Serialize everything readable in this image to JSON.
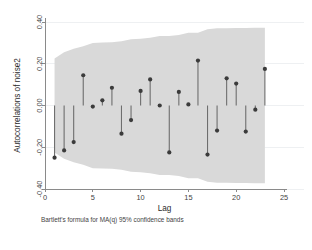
{
  "chart_data": {
    "type": "bar",
    "title": "",
    "subtitle": "",
    "xlabel": "Lag",
    "ylabel": "Autocorrelations of noise2",
    "note": "Bartlett's formula for MA(q) 95% confidence bands",
    "grid": true,
    "legend": null,
    "xlim": [
      0,
      25
    ],
    "ylim": [
      -0.4,
      0.4
    ],
    "xticks": [
      0,
      5,
      10,
      15,
      20,
      25
    ],
    "xticklabels": [
      "0",
      "5",
      "10",
      "15",
      "20",
      "25"
    ],
    "yticks": [
      -0.4,
      -0.2,
      0.0,
      0.2,
      0.4
    ],
    "yticklabels": [
      "-0.40",
      "-0.20",
      "0.00",
      "0.20",
      "0.40"
    ],
    "x": [
      1,
      2,
      3,
      4,
      5,
      6,
      7,
      8,
      9,
      10,
      11,
      12,
      13,
      14,
      15,
      16,
      17,
      18,
      19,
      20,
      21,
      22,
      23
    ],
    "categories": [
      "1",
      "2",
      "3",
      "4",
      "5",
      "6",
      "7",
      "8",
      "9",
      "10",
      "11",
      "12",
      "13",
      "14",
      "15",
      "16",
      "17",
      "18",
      "19",
      "20",
      "21",
      "22",
      "23"
    ],
    "values": [
      -0.25,
      -0.215,
      -0.175,
      0.145,
      -0.005,
      0.025,
      0.085,
      -0.135,
      -0.07,
      0.07,
      0.125,
      0.0,
      -0.225,
      0.065,
      0.005,
      0.215,
      -0.235,
      -0.12,
      0.13,
      0.105,
      -0.125,
      -0.02,
      0.175
    ],
    "series": [
      {
        "name": "Autocorrelation",
        "values": [
          -0.25,
          -0.215,
          -0.175,
          0.145,
          -0.005,
          0.025,
          0.085,
          -0.135,
          -0.07,
          0.07,
          0.125,
          0.0,
          -0.225,
          0.065,
          0.005,
          0.215,
          -0.235,
          -0.12,
          0.13,
          0.105,
          -0.125,
          -0.02,
          0.175
        ]
      }
    ],
    "confidence_band": {
      "name": "Bartlett 95% confidence band",
      "x": [
        1,
        2,
        3,
        4,
        5,
        6,
        7,
        8,
        9,
        10,
        11,
        12,
        13,
        14,
        15,
        16,
        17,
        18,
        19,
        20,
        21,
        22,
        23
      ],
      "upper": [
        0.225,
        0.255,
        0.272,
        0.284,
        0.3,
        0.302,
        0.303,
        0.308,
        0.317,
        0.32,
        0.324,
        0.333,
        0.333,
        0.338,
        0.348,
        0.349,
        0.365,
        0.37,
        0.37,
        0.371,
        0.371,
        0.372,
        0.372
      ],
      "lower": [
        -0.225,
        -0.255,
        -0.272,
        -0.284,
        -0.3,
        -0.302,
        -0.303,
        -0.308,
        -0.317,
        -0.32,
        -0.324,
        -0.333,
        -0.333,
        -0.338,
        -0.348,
        -0.349,
        -0.365,
        -0.37,
        -0.37,
        -0.371,
        -0.371,
        -0.372,
        -0.372
      ],
      "color": "#d9d9d9"
    },
    "colors": {
      "band": "#d9d9d9",
      "stem": "#6e6e6e",
      "marker": "#3b3b3b",
      "axis": "#8a8a8a",
      "grid": "#eef0f2",
      "background": "#ffffff"
    }
  }
}
